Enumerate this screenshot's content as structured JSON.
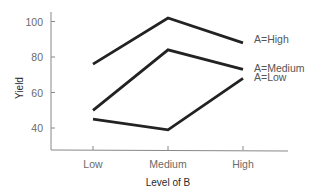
{
  "chart_data": {
    "type": "line",
    "title": "",
    "xlabel": "Level of B",
    "ylabel": "Yield",
    "categories": [
      "Low",
      "Medium",
      "High"
    ],
    "series": [
      {
        "name": "A=High",
        "values": [
          76,
          102,
          88
        ]
      },
      {
        "name": "A=Medium",
        "values": [
          50,
          84,
          73
        ]
      },
      {
        "name": "A=Low",
        "values": [
          45,
          39,
          68
        ]
      }
    ],
    "yticks": [
      40,
      60,
      80,
      100
    ],
    "ylim": [
      28,
      106
    ],
    "grid": false,
    "legend": "inline labels at right end of each line",
    "colors": {
      "line": "#222222",
      "axis": "#888888",
      "tick_text": "#6a6a6a"
    }
  }
}
